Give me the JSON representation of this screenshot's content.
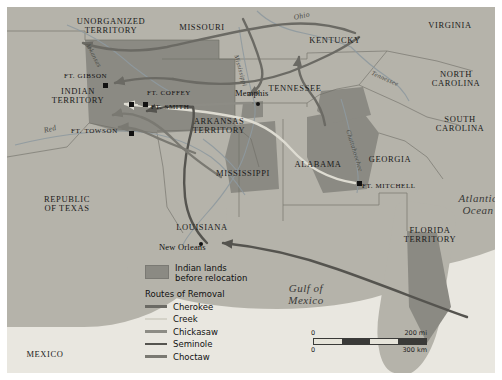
{
  "map": {
    "title": "Indian Removal Routes",
    "territories": [
      {
        "name": "UNORGANIZED\nTERRITORY",
        "x": 56,
        "y": 10,
        "w": 96,
        "cls": "state"
      },
      {
        "name": "MISSOURI",
        "x": 160,
        "y": 16,
        "w": 70,
        "cls": "state"
      },
      {
        "name": "VIRGINIA",
        "x": 408,
        "y": 14,
        "w": 70,
        "cls": "state"
      },
      {
        "name": "KENTUCKY",
        "x": 292,
        "y": 29,
        "w": 72,
        "cls": "state"
      },
      {
        "name": "INDIAN\nTERRITORY",
        "x": 32,
        "y": 80,
        "w": 78,
        "cls": "state"
      },
      {
        "name": "TENNESSEE",
        "x": 252,
        "y": 77,
        "w": 72,
        "cls": "state"
      },
      {
        "name": "NORTH\nCAROLINA",
        "x": 412,
        "y": 63,
        "w": 74,
        "cls": "state"
      },
      {
        "name": "ARKANSAS\nTERRITORY",
        "x": 175,
        "y": 110,
        "w": 74,
        "cls": "state"
      },
      {
        "name": "SOUTH\nCAROLINA",
        "x": 416,
        "y": 108,
        "w": 74,
        "cls": "state"
      },
      {
        "name": "MISSISSIPPI",
        "x": 200,
        "y": 162,
        "w": 72,
        "cls": "state"
      },
      {
        "name": "ALABAMA",
        "x": 278,
        "y": 153,
        "w": 66,
        "cls": "state"
      },
      {
        "name": "GEORGIA",
        "x": 352,
        "y": 148,
        "w": 62,
        "cls": "state"
      },
      {
        "name": "REPUBLIC\nOF TEXAS",
        "x": 22,
        "y": 188,
        "w": 76,
        "cls": "state"
      },
      {
        "name": "LOUISIANA",
        "x": 162,
        "y": 216,
        "w": 66,
        "cls": "state"
      },
      {
        "name": "FLORIDA\nTERRITORY",
        "x": 386,
        "y": 219,
        "w": 74,
        "cls": "state"
      },
      {
        "name": "MEXICO",
        "x": 8,
        "y": 343,
        "w": 60,
        "cls": "state"
      }
    ],
    "water_labels": [
      {
        "name": "Ohio",
        "x": 286,
        "y": 7,
        "rot": -12,
        "size": 7.5
      },
      {
        "name": "Arkansas",
        "x": 83,
        "y": 35,
        "rot": 62,
        "size": 6.5
      },
      {
        "name": "Mississippi",
        "x": 232,
        "y": 47,
        "rot": 74,
        "size": 6.5
      },
      {
        "name": "Tennessee",
        "x": 366,
        "y": 63,
        "rot": 24,
        "size": 6.5
      },
      {
        "name": "Red",
        "x": 36,
        "y": 120,
        "rot": -14,
        "size": 7.5
      },
      {
        "name": "Chattahoochee",
        "x": 344,
        "y": 122,
        "rot": 73,
        "size": 6.5
      }
    ],
    "oceans": [
      {
        "name": "Atlantic\nOcean",
        "x": 440,
        "y": 186,
        "w": 62
      },
      {
        "name": "Gulf of\nMexico",
        "x": 268,
        "y": 276,
        "w": 62
      }
    ],
    "cities": [
      {
        "name": "Memphis",
        "x": 228,
        "y": 82,
        "mx": 249,
        "my": 95,
        "marker": "dot",
        "align": "right"
      },
      {
        "name": "New Orleans",
        "x": 152,
        "y": 236,
        "mx": 192,
        "my": 235,
        "marker": "dot",
        "align": "left"
      }
    ],
    "forts": [
      {
        "name": "FT. GISON",
        "x": 57,
        "y": 66,
        "mx": 96,
        "my": 76,
        "align": "right"
      },
      {
        "name": "FT. COFFEY",
        "x": 140,
        "y": 83,
        "mx": 136,
        "my": 95,
        "align": "left"
      },
      {
        "name": "FT. SMITH",
        "x": 144,
        "y": 97,
        "mx": 122,
        "my": 95,
        "align": "left"
      },
      {
        "name": "FT. TOWSON",
        "x": 64,
        "y": 121,
        "mx": 122,
        "my": 124,
        "align": "right"
      },
      {
        "name": "FT. MITCHELL",
        "x": 355,
        "y": 176,
        "mx": 350,
        "my": 174,
        "align": "left"
      }
    ],
    "fort_names_display": [
      "FT. GIBSON",
      "FT. COFFEY",
      "FT. SMITH",
      "FT. TOWSON",
      "FT. MITCHELL"
    ]
  },
  "legend": {
    "area_swatch_label": "Indian lands\nbefore relocation",
    "area_swatch_color": "#8b8a83",
    "routes_title": "Routes of Removal",
    "routes": [
      {
        "name": "Cherokee",
        "color": "#6b6a64"
      },
      {
        "name": "Creek",
        "color": "#d4d2c8"
      },
      {
        "name": "Chickasaw",
        "color": "#8d8c85"
      },
      {
        "name": "Seminole",
        "color": "#55544f"
      },
      {
        "name": "Choctaw",
        "color": "#7a7972"
      }
    ]
  },
  "scale": {
    "miles_zero": "0",
    "miles_max": "200 mi",
    "km_zero": "0",
    "km_max": "300 km"
  }
}
